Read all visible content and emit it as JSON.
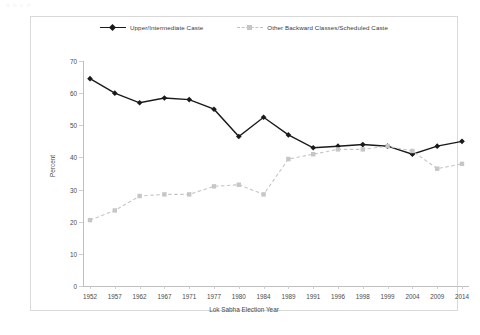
{
  "ghost_header": "a   b c d",
  "legend": {
    "items": [
      {
        "label": "Upper/Intermediate Caste",
        "style": "solid",
        "color": "#1a1a1a",
        "marker": "diamond"
      },
      {
        "label": "Other Backward Classes/Scheduled Caste",
        "style": "dashed",
        "color": "#c6c6c6",
        "marker": "square"
      }
    ]
  },
  "axes": {
    "y_title": "Percent",
    "x_title": "Lok Sabha Election Year",
    "y_ticks": [
      "0",
      "10",
      "20",
      "30",
      "40",
      "50",
      "60",
      "70"
    ]
  },
  "chart_data": {
    "type": "line",
    "title": "",
    "subtitle": "",
    "xlabel": "Lok Sabha Election Year",
    "ylabel": "Percent",
    "ylim": [
      0,
      70
    ],
    "grid": false,
    "legend_position": "top-center",
    "categories": [
      "1952",
      "1957",
      "1962",
      "1967",
      "1971",
      "1977",
      "1980",
      "1984",
      "1989",
      "1991",
      "1996",
      "1998",
      "1999",
      "2004",
      "2009",
      "2014"
    ],
    "series": [
      {
        "name": "Upper/Intermediate Caste",
        "color": "#1a1a1a",
        "style": "solid",
        "marker": "diamond",
        "values": [
          64.5,
          60.0,
          57.0,
          58.5,
          58.0,
          55.0,
          46.5,
          52.5,
          47.0,
          43.0,
          43.5,
          44.0,
          43.5,
          41.0,
          43.5,
          45.0
        ]
      },
      {
        "name": "Other Backward Classes/Scheduled Caste",
        "color": "#c6c6c6",
        "style": "dashed",
        "marker": "square",
        "values": [
          20.5,
          23.5,
          28.0,
          28.5,
          28.5,
          31.0,
          31.5,
          28.5,
          39.5,
          41.0,
          42.5,
          42.5,
          43.5,
          42.0,
          36.5,
          38.0
        ]
      }
    ]
  }
}
